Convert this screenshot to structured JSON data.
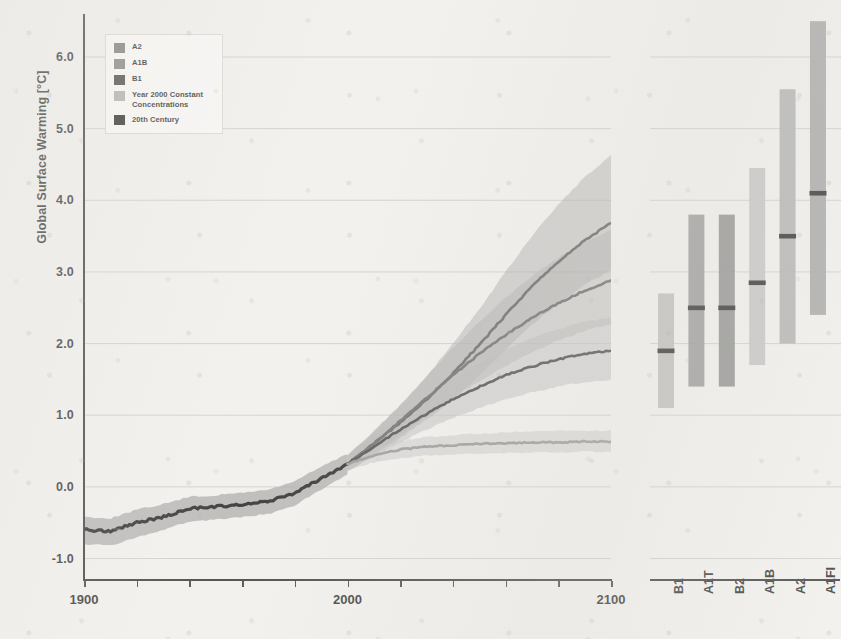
{
  "figure": {
    "y_axis_label": "Global Surface Warming [°C]",
    "y_ticks": [
      "-1.0",
      "0.0",
      "1.0",
      "2.0",
      "3.0",
      "4.0",
      "5.0",
      "6.0"
    ],
    "y_tick_values": [
      -1.0,
      0.0,
      1.0,
      2.0,
      3.0,
      4.0,
      5.0,
      6.0
    ],
    "x_ticks": [
      "1900",
      "2000",
      "2100"
    ],
    "x_tick_values": [
      1900,
      2000,
      2100
    ]
  },
  "legend": {
    "items": [
      {
        "label": "A2",
        "color": "#6f6f6f"
      },
      {
        "label": "A1B",
        "color": "#767676"
      },
      {
        "label": "B1",
        "color": "#333333"
      },
      {
        "label": "Year 2000 Constant\nConcentrations",
        "color": "#a9a9a9"
      },
      {
        "label": "20th Century",
        "color": "#141414"
      }
    ]
  },
  "chart_data": {
    "type": "line",
    "title": "",
    "xlabel": "",
    "ylabel": "Global Surface Warming [°C]",
    "xlim": [
      1900,
      2100
    ],
    "ylim": [
      -1.3,
      6.6
    ],
    "grid": true,
    "legend_position": "top-left",
    "x_ticks": [
      1900,
      2000,
      2100
    ],
    "y_ticks": [
      -1.0,
      0.0,
      1.0,
      2.0,
      3.0,
      4.0,
      5.0,
      6.0
    ],
    "series": [
      {
        "name": "20th Century",
        "color": "#141414",
        "band_color": "#9a9a9a",
        "x": [
          1900,
          1910,
          1920,
          1930,
          1940,
          1950,
          1960,
          1970,
          1980,
          1990,
          2000
        ],
        "values": [
          -0.6,
          -0.62,
          -0.5,
          -0.42,
          -0.3,
          -0.28,
          -0.24,
          -0.2,
          -0.08,
          0.12,
          0.32
        ],
        "band_lo": [
          -0.8,
          -0.82,
          -0.7,
          -0.6,
          -0.48,
          -0.46,
          -0.42,
          -0.38,
          -0.26,
          -0.04,
          0.18
        ],
        "band_hi": [
          -0.42,
          -0.44,
          -0.32,
          -0.24,
          -0.14,
          -0.12,
          -0.08,
          -0.04,
          0.08,
          0.28,
          0.46
        ]
      },
      {
        "name": "A2",
        "color": "#555555",
        "band_color": "#9e9e9e",
        "x": [
          2000,
          2010,
          2020,
          2030,
          2040,
          2050,
          2060,
          2070,
          2080,
          2090,
          2100
        ],
        "values": [
          0.32,
          0.6,
          0.9,
          1.22,
          1.58,
          1.98,
          2.4,
          2.8,
          3.14,
          3.44,
          3.68
        ],
        "band_lo": [
          0.22,
          0.44,
          0.68,
          0.94,
          1.22,
          1.56,
          1.92,
          2.26,
          2.56,
          2.82,
          3.02
        ],
        "band_hi": [
          0.44,
          0.78,
          1.14,
          1.54,
          2.0,
          2.48,
          3.0,
          3.5,
          3.94,
          4.32,
          4.62
        ]
      },
      {
        "name": "A1B",
        "color": "#5d5d5d",
        "band_color": "#a4a4a4",
        "x": [
          2000,
          2010,
          2020,
          2030,
          2040,
          2050,
          2060,
          2070,
          2080,
          2090,
          2100
        ],
        "values": [
          0.32,
          0.6,
          0.92,
          1.24,
          1.56,
          1.86,
          2.12,
          2.36,
          2.56,
          2.74,
          2.88
        ],
        "band_lo": [
          0.22,
          0.46,
          0.72,
          0.98,
          1.24,
          1.48,
          1.68,
          1.88,
          2.04,
          2.18,
          2.28
        ],
        "band_hi": [
          0.44,
          0.76,
          1.14,
          1.54,
          1.94,
          2.3,
          2.64,
          2.94,
          3.2,
          3.42,
          3.58
        ]
      },
      {
        "name": "B1",
        "color": "#3a3a3a",
        "band_color": "#b0b0b0",
        "x": [
          2000,
          2010,
          2020,
          2030,
          2040,
          2050,
          2060,
          2070,
          2080,
          2090,
          2100
        ],
        "values": [
          0.32,
          0.56,
          0.8,
          1.02,
          1.22,
          1.4,
          1.56,
          1.68,
          1.78,
          1.86,
          1.9
        ],
        "band_lo": [
          0.22,
          0.42,
          0.62,
          0.8,
          0.96,
          1.1,
          1.22,
          1.32,
          1.4,
          1.46,
          1.5
        ],
        "band_hi": [
          0.44,
          0.72,
          1.0,
          1.26,
          1.5,
          1.72,
          1.92,
          2.08,
          2.2,
          2.3,
          2.36
        ]
      },
      {
        "name": "Year 2000 Constant Concentrations",
        "color": "#8d8d8d",
        "band_color": "#bcbcbc",
        "x": [
          2000,
          2010,
          2020,
          2030,
          2040,
          2050,
          2060,
          2070,
          2080,
          2090,
          2100
        ],
        "values": [
          0.32,
          0.44,
          0.52,
          0.56,
          0.58,
          0.6,
          0.61,
          0.62,
          0.62,
          0.63,
          0.63
        ],
        "band_lo": [
          0.24,
          0.34,
          0.4,
          0.44,
          0.45,
          0.46,
          0.47,
          0.48,
          0.48,
          0.49,
          0.49
        ],
        "band_hi": [
          0.4,
          0.54,
          0.64,
          0.7,
          0.72,
          0.74,
          0.76,
          0.77,
          0.78,
          0.78,
          0.79
        ]
      }
    ]
  },
  "bar_panel": {
    "type": "bar",
    "description": "Likely range of global surface warming at 2090-2099 for six SRES marker scenarios, with best estimate marker",
    "categories": [
      "B1",
      "A1T",
      "B2",
      "A1B",
      "A2",
      "A1FI"
    ],
    "bars": [
      {
        "label": "B1",
        "low": 1.1,
        "high": 2.7,
        "best": 1.9,
        "color": "#b4b4b4"
      },
      {
        "label": "A1T",
        "low": 1.4,
        "high": 3.8,
        "best": 2.5,
        "color": "#8b8b8b"
      },
      {
        "label": "B2",
        "low": 1.4,
        "high": 3.8,
        "best": 2.5,
        "color": "#7f7f7f"
      },
      {
        "label": "A1B",
        "low": 1.7,
        "high": 4.45,
        "best": 2.85,
        "color": "#bdbdbd"
      },
      {
        "label": "A2",
        "low": 2.0,
        "high": 5.55,
        "best": 3.5,
        "color": "#a7a7a7"
      },
      {
        "label": "A1FI",
        "low": 2.4,
        "high": 6.5,
        "best": 4.1,
        "color": "#9a9a9a"
      }
    ],
    "marker_color": "#1a1a1a"
  }
}
